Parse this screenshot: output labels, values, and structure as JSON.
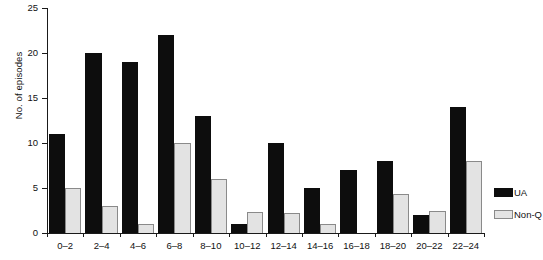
{
  "chart_data": {
    "type": "bar",
    "title": "",
    "xlabel": "",
    "ylabel": "No. of episodes",
    "ylim": [
      0,
      25
    ],
    "yticks": [
      0,
      5,
      10,
      15,
      20,
      25
    ],
    "grid": false,
    "legend_position": "right",
    "categories": [
      "0–2",
      "2–4",
      "4–6",
      "6–8",
      "8–10",
      "10–12",
      "12–14",
      "14–16",
      "16–18",
      "18–20",
      "20–22",
      "22–24"
    ],
    "series": [
      {
        "name": "UA",
        "color": "#0d0d0d",
        "values": [
          11,
          20,
          19,
          22,
          13,
          1,
          10,
          5,
          7,
          8,
          2,
          14
        ]
      },
      {
        "name": "Non-Q",
        "color": "#e3e3e3",
        "values": [
          5,
          3,
          1,
          10,
          6,
          2.3,
          2.2,
          1,
          0,
          4.3,
          2.4,
          8
        ]
      }
    ]
  },
  "legend": {
    "items": [
      {
        "label": "UA",
        "swatch": "black-square-swatch"
      },
      {
        "label": "Non-Q",
        "swatch": "gray-square-swatch"
      }
    ]
  },
  "axes": {
    "y_label": "No. of episodes",
    "y_tick_labels": [
      "0",
      "5",
      "10",
      "15",
      "20",
      "25"
    ],
    "x_tick_labels": [
      "0–2",
      "2–4",
      "4–6",
      "6–8",
      "8–10",
      "10–12",
      "12–14",
      "14–16",
      "16–18",
      "18–20",
      "20–22",
      "22–24"
    ]
  }
}
